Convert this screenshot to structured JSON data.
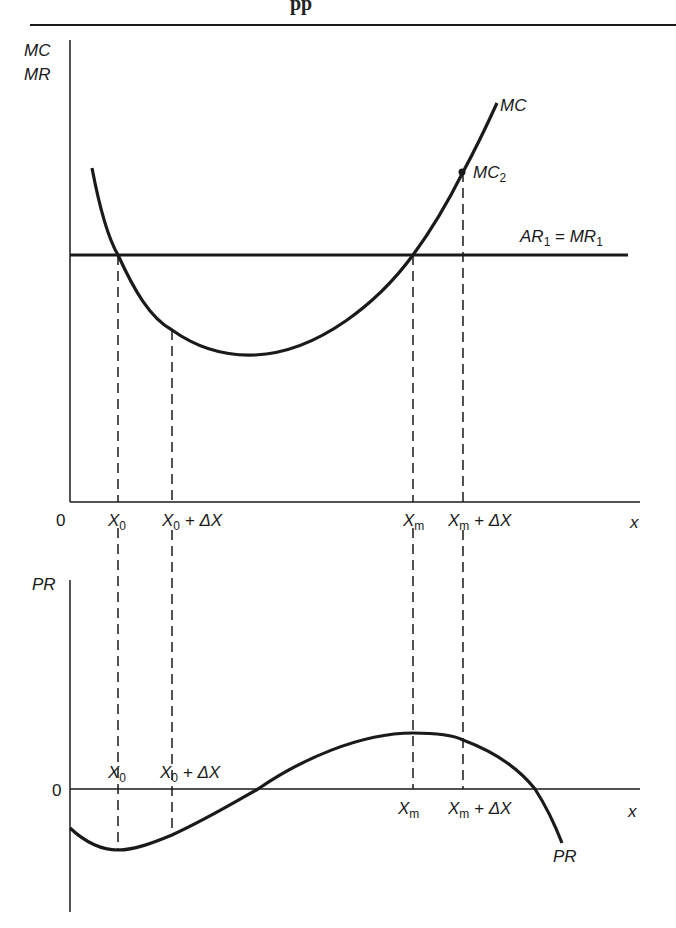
{
  "header": {
    "fragment": "pp"
  },
  "top_chart": {
    "y_axis_label_1": "MC",
    "y_axis_label_2": "MR",
    "origin": "0",
    "x_axis_label": "x",
    "mc_label": "MC",
    "mc2_label": "MC",
    "mc2_sub": "2",
    "ar_label": "AR",
    "ar_sub": "1",
    "eq": " = ",
    "mr_label": "MR",
    "mr_sub": "1",
    "ticks": {
      "x0": "X",
      "x0_sub": "0",
      "x0dx": "X",
      "x0dx_sub": "0",
      "x0dx_tail": " + ΔX",
      "xm": "X",
      "xm_sub": "m",
      "xmdx": "X",
      "xmdx_sub": "m",
      "xmdx_tail": " + ΔX"
    }
  },
  "bottom_chart": {
    "y_axis_label": "PR",
    "origin": "0",
    "x_axis_label": "x",
    "pr_label": "PR",
    "ticks": {
      "x0": "X",
      "x0_sub": "0",
      "x0dx": "X",
      "x0dx_sub": "0",
      "x0dx_tail": " + ΔX",
      "xm": "X",
      "xm_sub": "m",
      "xmdx": "X",
      "xmdx_sub": "m",
      "xmdx_tail": " + ΔX"
    }
  },
  "colors": {
    "ink": "#1a1a1a",
    "background": "#ffffff"
  }
}
